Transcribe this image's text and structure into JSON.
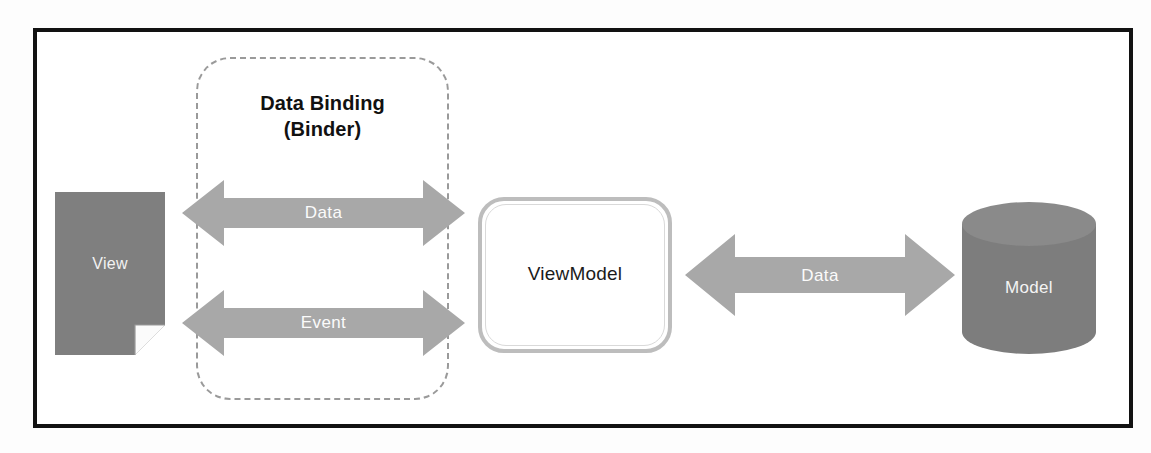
{
  "diagram": {
    "binder": {
      "label_line1": "Data Binding",
      "label_line2": "(Binder)"
    },
    "nodes": {
      "view": {
        "label": "View",
        "shape": "document"
      },
      "viewmodel": {
        "label": "ViewModel",
        "shape": "rounded-rectangle"
      },
      "model": {
        "label": "Model",
        "shape": "cylinder"
      }
    },
    "connectors": [
      {
        "label": "Data",
        "from": "view",
        "to": "viewmodel",
        "direction": "bidirectional"
      },
      {
        "label": "Event",
        "from": "view",
        "to": "viewmodel",
        "direction": "bidirectional"
      },
      {
        "label": "Data",
        "from": "viewmodel",
        "to": "model",
        "direction": "bidirectional"
      }
    ],
    "colors": {
      "frame": "#121212",
      "node_fill": "#808080",
      "arrow_fill": "#a6a6a6",
      "dashed_border": "#9a9a9a",
      "viewmodel_border": "#bdbdbd",
      "label_text": "#f4f4f4"
    }
  }
}
